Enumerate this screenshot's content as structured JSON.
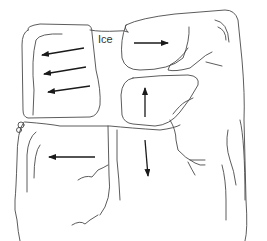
{
  "diagram": {
    "label": "Ice",
    "regions": [
      {
        "name": "upper-left-block",
        "arrows": [
          "left",
          "left",
          "left"
        ]
      },
      {
        "name": "upper-right-block",
        "arrows": [
          "right"
        ]
      },
      {
        "name": "middle-right-block",
        "arrows": [
          "up"
        ]
      },
      {
        "name": "lower-left-block",
        "arrows": [
          "left"
        ]
      },
      {
        "name": "lower-right-block",
        "arrows": [
          "down"
        ]
      }
    ]
  }
}
